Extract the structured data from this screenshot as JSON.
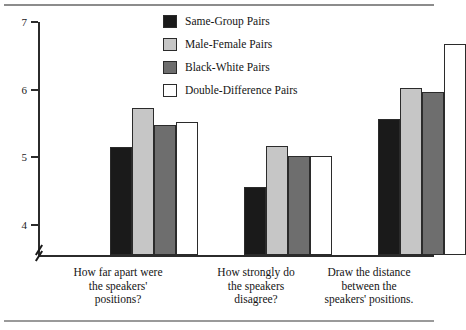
{
  "chart_data": {
    "type": "bar",
    "title": "",
    "subtitle": "",
    "xlabel": "",
    "ylabel": "",
    "ylim": [
      3.55,
      7.0
    ],
    "yticks": [
      4,
      5,
      6,
      7
    ],
    "ytick_labels": [
      "4",
      "5",
      "6",
      "7"
    ],
    "axis_break": true,
    "axis_break_note": "y-axis broken below 4",
    "grid": false,
    "legend_position": "top-center",
    "categories": [
      "How far apart were the speakers' positions?",
      "How strongly do the speakers disagree?",
      "Draw the distance between the speakers' positions."
    ],
    "category_lines": [
      [
        "How far apart were",
        "the speakers'",
        "positions?"
      ],
      [
        "How strongly do",
        "the speakers",
        "disagree?"
      ],
      [
        "Draw the distance",
        "between the",
        "speakers' positions."
      ]
    ],
    "series": [
      {
        "name": "Same-Group Pairs",
        "color": "#1a1a1a",
        "values": [
          5.15,
          4.55,
          5.57
        ]
      },
      {
        "name": "Male-Female Pairs",
        "color": "#c6c6c6",
        "values": [
          5.73,
          5.17,
          6.03
        ]
      },
      {
        "name": "Black-White Pairs",
        "color": "#6e6e6e",
        "values": [
          5.48,
          5.02,
          5.97
        ]
      },
      {
        "name": "Double-Difference Pairs",
        "color": "#ffffff",
        "values": [
          5.52,
          5.02,
          6.68
        ]
      }
    ]
  },
  "legend": {
    "items": [
      {
        "label": "Same-Group Pairs"
      },
      {
        "label": "Male-Female Pairs"
      },
      {
        "label": "Black-White Pairs"
      },
      {
        "label": "Double-Difference Pairs"
      }
    ]
  },
  "axis": {
    "tick_labels": [
      "7",
      "6",
      "5",
      "4"
    ]
  },
  "colors": {
    "axis": "#2b2b2b",
    "rule": "#8c8c8c",
    "background": "#ffffff",
    "text": "#141414"
  }
}
